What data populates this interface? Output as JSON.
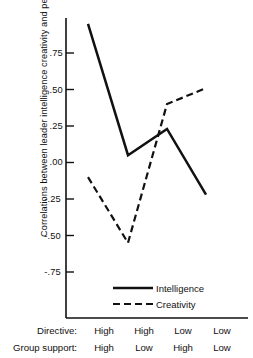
{
  "chart_data": {
    "type": "line",
    "title": "",
    "ylabel": "Correlations between leader intelligence creativity and performance",
    "xlabel": "",
    "categories": [
      "1",
      "2",
      "3",
      "4"
    ],
    "ylim": [
      -0.875,
      1.0
    ],
    "grid": false,
    "legend_position": "bottom-center",
    "ytick_labels": [
      ".75",
      ".50",
      ".25",
      ".00",
      "-.25",
      "-.50",
      "-.75"
    ],
    "ytick_values": [
      0.75,
      0.5,
      0.25,
      0.0,
      -0.25,
      -0.5,
      -0.75
    ],
    "series": [
      {
        "name": "Intelligence",
        "style": "solid",
        "values": [
          0.95,
          0.05,
          0.23,
          -0.22
        ]
      },
      {
        "name": "Creativity",
        "style": "dashed",
        "values": [
          -0.1,
          -0.55,
          0.4,
          0.51
        ]
      }
    ]
  },
  "axis": {
    "y_title": "Correlations between leader intelligence creativity and performance",
    "ticks": [
      {
        "label": ".75",
        "value": 0.75
      },
      {
        "label": ".50",
        "value": 0.5
      },
      {
        "label": ".25",
        "value": 0.25
      },
      {
        "label": ".00",
        "value": 0.0
      },
      {
        "label": "-.25",
        "value": -0.25
      },
      {
        "label": "-.50",
        "value": -0.5
      },
      {
        "label": "-.75",
        "value": -0.75
      }
    ]
  },
  "legend": {
    "items": [
      {
        "label": "Intelligence",
        "style": "solid"
      },
      {
        "label": "Creativity",
        "style": "dashed"
      }
    ]
  },
  "category_table": {
    "rows": [
      {
        "title": "Directive:",
        "cells": [
          "High",
          "High",
          "Low",
          "Low"
        ]
      },
      {
        "title": "Group support:",
        "cells": [
          "High",
          "Low",
          "High",
          "Low"
        ]
      }
    ]
  },
  "colors": {
    "line": "#111111",
    "axis": "#111111",
    "background": "#ffffff"
  }
}
